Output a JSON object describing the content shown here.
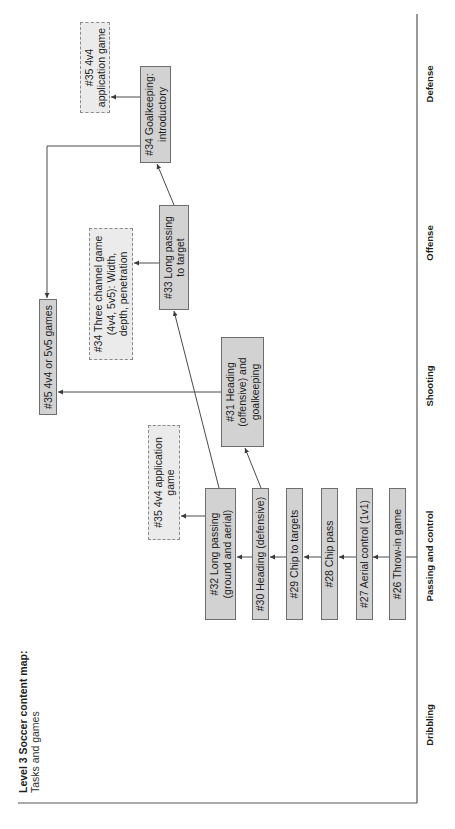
{
  "title": "Level 3 Soccer content map:",
  "subtitle": "Tasks and games",
  "axis": {
    "categories": [
      "Dribbling",
      "Passing and control",
      "Shooting",
      "Offense",
      "Defense"
    ]
  },
  "nodes": {
    "n26": {
      "lines": [
        "#26 Throw-in game"
      ],
      "style": "solid",
      "column": "Passing and control"
    },
    "n27": {
      "lines": [
        "#27 Aerial control (1v1)"
      ],
      "style": "solid",
      "column": "Passing and control"
    },
    "n28": {
      "lines": [
        "#28 Chip pass"
      ],
      "style": "solid",
      "column": "Passing and control"
    },
    "n29": {
      "lines": [
        "#29 Chip to targets"
      ],
      "style": "solid",
      "column": "Passing and control"
    },
    "n30": {
      "lines": [
        "#30 Heading (defensive)"
      ],
      "style": "solid",
      "column": "Passing and control"
    },
    "n32": {
      "lines": [
        "#32 Long passing",
        "(ground and aerial)"
      ],
      "style": "solid",
      "column": "Passing and control"
    },
    "n35_low": {
      "lines": [
        "#35 4v4 application",
        "game"
      ],
      "style": "dashed",
      "column": "Passing and control"
    },
    "n31": {
      "lines": [
        "#31 Heading",
        "(offensive) and",
        "goalkeeping"
      ],
      "style": "solid",
      "column": "Shooting"
    },
    "n35_games": {
      "lines": [
        "#35 4v4 or 5v5 games"
      ],
      "style": "solid",
      "column": "Shooting"
    },
    "n33": {
      "lines": [
        "#33 Long passing",
        "to target"
      ],
      "style": "solid",
      "column": "Offense"
    },
    "n34_tc": {
      "lines": [
        "#34 Three channel game",
        "(4v4, 5v5): Width,",
        "depth, penetration"
      ],
      "style": "dashed",
      "column": "Offense"
    },
    "n34_gk": {
      "lines": [
        "#34 Goalkeeping:",
        "introductory"
      ],
      "style": "solid",
      "column": "Defense"
    },
    "n35_top": {
      "lines": [
        "#35 4v4",
        "application game"
      ],
      "style": "dashed",
      "column": "Defense"
    }
  },
  "edges": [
    {
      "from": "n26",
      "to": "n27"
    },
    {
      "from": "n27",
      "to": "n28"
    },
    {
      "from": "n28",
      "to": "n29"
    },
    {
      "from": "n29",
      "to": "n30"
    },
    {
      "from": "n30",
      "to": "n32"
    },
    {
      "from": "n30",
      "to": "n31"
    },
    {
      "from": "n32",
      "to": "n35_low"
    },
    {
      "from": "n32",
      "to": "n33"
    },
    {
      "from": "n31",
      "to": "n35_games"
    },
    {
      "from": "n33",
      "to": "n34_tc"
    },
    {
      "from": "n33",
      "to": "n34_gk"
    },
    {
      "from": "n34_gk",
      "to": "n35_top"
    },
    {
      "from": "n34_gk",
      "to": "n35_games"
    }
  ],
  "colors": {
    "task_box_fill": "#d2d2d2",
    "task_box_border": "#6e6e6e",
    "game_box_fill": "#ebebeb",
    "game_box_border": "#8a8a8a",
    "line": "#4a4a4a"
  }
}
